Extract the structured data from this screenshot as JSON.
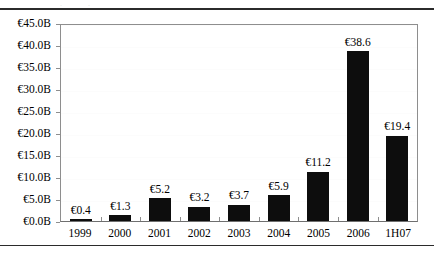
{
  "chart_data": {
    "type": "bar",
    "title": "",
    "subtitle": "",
    "xlabel": "",
    "ylabel": "",
    "categories": [
      "1999",
      "2000",
      "2001",
      "2002",
      "2003",
      "2004",
      "2005",
      "2006",
      "1H07"
    ],
    "values": [
      0.4,
      1.3,
      5.2,
      3.2,
      3.7,
      5.9,
      11.2,
      38.6,
      19.4
    ],
    "data_labels": [
      "€0.4",
      "€1.3",
      "€5.2",
      "€3.2",
      "€3.7",
      "€5.9",
      "€11.2",
      "€38.6",
      "€19.4"
    ],
    "ylim": [
      0,
      45
    ],
    "ytick_values": [
      0,
      5,
      10,
      15,
      20,
      25,
      30,
      35,
      40,
      45
    ],
    "ytick_labels": [
      "€0.0B",
      "€5.0B",
      "€10.0B",
      "€15.0B",
      "€20.0B",
      "€25.0B",
      "€30.0B",
      "€35.0B",
      "€40.0B",
      "€45.0B"
    ],
    "grid": true,
    "legend": null,
    "legend_position": "none",
    "bar_color": "#0d0d0d",
    "axis_color": "#8e8e8e",
    "unit": "€B",
    "annotations": []
  },
  "figure": {
    "ghost_title_text": ". ."
  }
}
